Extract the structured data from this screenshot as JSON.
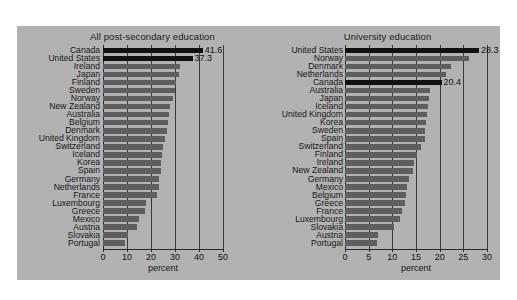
{
  "figure": {
    "background_color": "#b2b2b2",
    "bar_color": "#5e5e5e",
    "highlight_color": "#101010"
  },
  "chart_data": [
    {
      "type": "bar",
      "orientation": "horizontal",
      "title": "All post-secondary education",
      "xlabel": "percent",
      "ylabel": "",
      "xlim": [
        0,
        50
      ],
      "xticks": [
        0,
        10,
        20,
        30,
        40,
        50
      ],
      "xtick_labels": [
        "0",
        "10",
        "20",
        "30",
        "40",
        "50"
      ],
      "grid": true,
      "legend": "none",
      "highlighted": [
        "Canada",
        "United States"
      ],
      "categories": [
        "Canada",
        "United States",
        "Ireland",
        "Japan",
        "Finland",
        "Sweden",
        "Norway",
        "New Zealand",
        "Australia",
        "Belgium",
        "Denmark",
        "United Kingdom",
        "Switzerland",
        "Iceland",
        "Korea",
        "Spain",
        "Germany",
        "Netherlands",
        "France",
        "Luxembourg",
        "Greece",
        "Mexico",
        "Austria",
        "Slovakia",
        "Portugal"
      ],
      "values": [
        41.6,
        37.3,
        32.0,
        31.5,
        30.5,
        30.0,
        29.0,
        28.0,
        27.5,
        27.0,
        26.5,
        26.0,
        25.0,
        24.5,
        24.0,
        24.0,
        23.5,
        23.5,
        22.5,
        18.0,
        17.5,
        15.0,
        14.0,
        10.5,
        9.0
      ],
      "data_labels": {
        "Canada": "41.6",
        "United States": "37.3"
      }
    },
    {
      "type": "bar",
      "orientation": "horizontal",
      "title": "University education",
      "xlabel": "percent",
      "ylabel": "",
      "xlim": [
        0,
        30
      ],
      "xticks": [
        0,
        5,
        10,
        15,
        20,
        25,
        30
      ],
      "xtick_labels": [
        "0",
        "5",
        "10",
        "15",
        "20",
        "25",
        "30"
      ],
      "grid": true,
      "legend": "none",
      "highlighted": [
        "United States",
        "Canada"
      ],
      "categories": [
        "United States",
        "Norway",
        "Denmark",
        "Netherlands",
        "Canada",
        "Australia",
        "Japan",
        "Iceland",
        "United Kingdom",
        "Korea",
        "Sweden",
        "Spain",
        "Switzerland",
        "Finland",
        "Ireland",
        "New Zealand",
        "Germany",
        "Mexico",
        "Belgium",
        "Greece",
        "France",
        "Luxembourg",
        "Slovakia",
        "Austria",
        "Portugal"
      ],
      "values": [
        28.3,
        26.2,
        22.4,
        21.4,
        20.4,
        18.0,
        17.8,
        17.6,
        17.4,
        17.2,
        17.0,
        17.0,
        16.0,
        15.2,
        14.6,
        14.4,
        13.6,
        13.2,
        12.8,
        12.6,
        12.0,
        11.6,
        10.4,
        7.0,
        6.8
      ],
      "data_labels": {
        "United States": "28.3",
        "Canada": "20.4"
      }
    }
  ]
}
